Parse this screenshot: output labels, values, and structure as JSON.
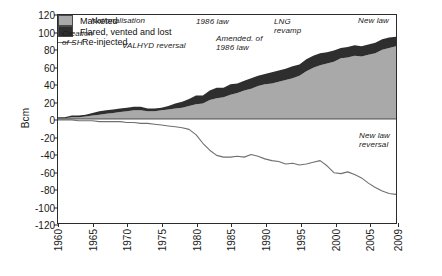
{
  "chart_data": {
    "type": "area",
    "title": "",
    "xlabel": "",
    "ylabel": "Bcm",
    "xlim": [
      1960,
      2009
    ],
    "ylim": [
      -120,
      120
    ],
    "grid": false,
    "legend_position": "inside-lower-left",
    "ytick_labels": [
      "120",
      "100",
      "80",
      "60",
      "40",
      "20",
      "0",
      "-20",
      "-40",
      "-60",
      "-80",
      "-100",
      "-120"
    ],
    "ytick_values": [
      120,
      100,
      80,
      60,
      40,
      20,
      0,
      -20,
      -40,
      -60,
      -80,
      -100,
      -120
    ],
    "xtick_labels": [
      "1960",
      "1965",
      "1970",
      "1975",
      "1980",
      "1985",
      "1990",
      "1995",
      "2000",
      "2005",
      "2009"
    ],
    "xtick_values": [
      1960,
      1965,
      1970,
      1975,
      1980,
      1985,
      1990,
      1995,
      2000,
      2005,
      2009
    ],
    "x": [
      1960,
      1961,
      1962,
      1963,
      1964,
      1965,
      1966,
      1967,
      1968,
      1969,
      1970,
      1971,
      1972,
      1973,
      1974,
      1975,
      1976,
      1977,
      1978,
      1979,
      1980,
      1981,
      1982,
      1983,
      1984,
      1985,
      1986,
      1987,
      1988,
      1989,
      1990,
      1991,
      1992,
      1993,
      1994,
      1995,
      1996,
      1997,
      1998,
      1999,
      2000,
      2001,
      2002,
      2003,
      2004,
      2005,
      2006,
      2007,
      2008,
      2009
    ],
    "series": [
      {
        "name": "Marketed",
        "color": "#a9a9a9",
        "stack": "positive",
        "values": [
          1,
          1,
          2,
          2,
          3,
          4,
          5,
          6,
          7,
          8,
          9,
          10,
          10,
          9,
          9,
          10,
          11,
          12,
          13,
          15,
          17,
          18,
          22,
          24,
          25,
          28,
          30,
          33,
          35,
          38,
          40,
          41,
          43,
          45,
          47,
          50,
          55,
          59,
          62,
          64,
          66,
          70,
          71,
          73,
          72,
          74,
          76,
          80,
          82,
          84
        ]
      },
      {
        "name": "Flared, vented and lost",
        "color": "#2e2e2e",
        "stack": "positive",
        "values": [
          1,
          1,
          2,
          2,
          2,
          3,
          4,
          4,
          4,
          4,
          4,
          4,
          4,
          3,
          3,
          3,
          4,
          6,
          7,
          8,
          10,
          9,
          11,
          12,
          11,
          12,
          11,
          11,
          12,
          12,
          12,
          13,
          13,
          13,
          14,
          13,
          14,
          14,
          14,
          13,
          13,
          12,
          12,
          12,
          12,
          12,
          12,
          12,
          12,
          11
        ]
      },
      {
        "name": "Re-injected",
        "color": "#6f6f6f",
        "stack": "negative",
        "values": [
          -1,
          -1,
          -1,
          -2,
          -2,
          -2,
          -3,
          -3,
          -3,
          -3,
          -4,
          -4,
          -5,
          -5,
          -6,
          -7,
          -8,
          -9,
          -10,
          -12,
          -18,
          -28,
          -36,
          -42,
          -44,
          -44,
          -43,
          -44,
          -41,
          -43,
          -46,
          -48,
          -49,
          -52,
          -51,
          -53,
          -52,
          -50,
          -48,
          -54,
          -62,
          -63,
          -61,
          -64,
          -68,
          -74,
          -79,
          -83,
          -86,
          -87
        ]
      }
    ],
    "annotations": [
      {
        "id": "nationalisation",
        "text": "Nationalisation",
        "x_px": 90,
        "y_px": 15
      },
      {
        "id": "creation-of-sh",
        "text": "Creation\nof SH",
        "x_px": 61,
        "y_px": 28
      },
      {
        "id": "valhyd-reversal",
        "text": "VALHYD reversal",
        "x_px": 121,
        "y_px": 40
      },
      {
        "id": "1986-law",
        "text": "1986 law",
        "x_px": 195,
        "y_px": 16
      },
      {
        "id": "amended-1986-law",
        "text": "Amended. of\n1986 law",
        "x_px": 215,
        "y_px": 33
      },
      {
        "id": "lng-revamp",
        "text": "LNG\nrevamp",
        "x_px": 273,
        "y_px": 16
      },
      {
        "id": "new-law",
        "text": "New law",
        "x_px": 357,
        "y_px": 15
      },
      {
        "id": "new-law-reversal",
        "text": "New law\nreversal",
        "x_px": 358,
        "y_px": 130
      }
    ],
    "legend": [
      {
        "id": "marketed",
        "label": "Marketed",
        "marker": "swatch",
        "color": "#a9a9a9"
      },
      {
        "id": "flared-vented-lost",
        "label": "Flared, vented and lost",
        "marker": "swatch",
        "color": "#2e2e2e"
      },
      {
        "id": "re-injected",
        "label": "Re-injected",
        "marker": "line",
        "color": "#6f6f6f"
      }
    ]
  }
}
